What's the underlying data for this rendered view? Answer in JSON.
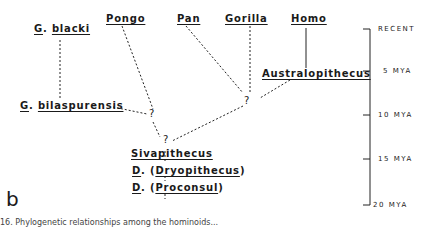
{
  "panel_label": "b",
  "taxa": {
    "g_blacki": {
      "genus": "G",
      "species": "blacki"
    },
    "pongo": "Pongo",
    "pan": "Pan",
    "gorilla": "Gorilla",
    "homo": "Homo",
    "australopithecus": "Australopithecus",
    "g_bilaspurensis": {
      "genus": "G",
      "species": "bilaspurensis"
    },
    "sivapithecus": "Sivapithecus",
    "dryopithecus": {
      "genus": "D",
      "name": "Dryopithecus"
    },
    "proconsul": {
      "genus": "D",
      "name": "Proconsul"
    }
  },
  "uncertain_marker": "?",
  "timescale": [
    "RECENT",
    "5 MYA",
    "10 MYA",
    "15 MYA",
    "20 MYA"
  ],
  "caption": "16. Phylogenetic relationships among the hominoids..."
}
